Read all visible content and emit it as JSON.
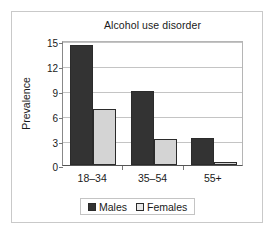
{
  "chart_data": {
    "type": "bar",
    "title": "Alcohol use disorder",
    "xlabel": "",
    "ylabel": "Prevalence",
    "categories": [
      "18–34",
      "35–54",
      "55+"
    ],
    "series": [
      {
        "name": "Males",
        "color": "#333333",
        "values": [
          14.4,
          8.9,
          3.3
        ]
      },
      {
        "name": "Females",
        "color": "#d4d4d4",
        "values": [
          6.7,
          3.1,
          0.4
        ]
      }
    ],
    "ylim": [
      0,
      15
    ],
    "yticks": [
      0,
      3,
      6,
      9,
      12,
      15
    ],
    "ytick_labels": [
      "0",
      "3",
      "6",
      "9",
      "12",
      "15"
    ],
    "grid": true,
    "legend_position": "bottom"
  }
}
